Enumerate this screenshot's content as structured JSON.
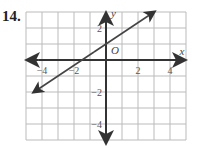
{
  "problem_number": "14.",
  "chart_data": {
    "type": "line",
    "title": "",
    "xlabel": "x",
    "ylabel": "y",
    "origin_label": "O",
    "xlim": [
      -5,
      5
    ],
    "ylim": [
      -5,
      3
    ],
    "grid": true,
    "x_ticks": [
      -4,
      -2,
      2,
      4
    ],
    "y_ticks": [
      2,
      -2,
      -4
    ],
    "x_tick_labels": [
      "−4",
      "−2",
      "2",
      "4"
    ],
    "y_tick_labels": [
      "2",
      "−2",
      "−4"
    ],
    "series": [
      {
        "name": "line",
        "slope": 0.6667,
        "intercept": 1,
        "x": [
          -4.5,
          3
        ],
        "y": [
          -2,
          3
        ],
        "arrows": "both"
      }
    ]
  },
  "colors": {
    "axis": "#333333",
    "grid": "#bbbbbb",
    "line": "#444444"
  }
}
